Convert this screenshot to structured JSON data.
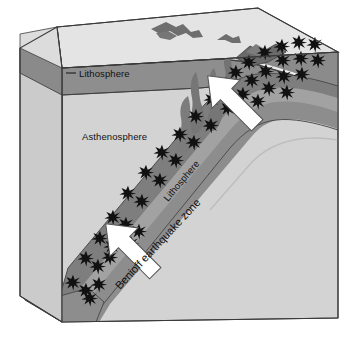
{
  "figure": {
    "type": "geologic-block-diagram"
  },
  "labels": {
    "lithosphere_upper": "Lithosphere",
    "asthenosphere": "Asthenosphere",
    "lithosphere_slab": "Lithosphere",
    "benioff_zone": "Benioff earthquake zone"
  },
  "icons": {
    "earthquake_focus": "star-icon",
    "motion_arrow": "arrow-icon",
    "magma_plume": "magma-plume-icon",
    "volcanic_arc": "volcano-icon"
  },
  "colors": {
    "background": "#ffffff",
    "block_top": "#e3e3e3",
    "block_front": "#d2d2d2",
    "block_left": "#c9c9c9",
    "lithosphere_band": "#8e8e8e",
    "lithosphere_band_dark": "#6f6f6f",
    "crust_thin": "#efefef",
    "slab_core": "#9a9a9a",
    "slab_edge": "#6a6a6a",
    "magma": "#7b7b7b",
    "earthquake_star": "#111111",
    "arrow_fill": "#ffffff",
    "arrow_stroke": "#4a4a4a",
    "outline": "#3a3a3a"
  },
  "geometry": {
    "block_corners": {
      "top_back_left": [
        57,
        27
      ],
      "top_back_right": [
        258,
        8
      ],
      "top_front_right": [
        338,
        52
      ],
      "top_front_left": [
        62,
        68
      ],
      "bottom_front_left": [
        62,
        322
      ],
      "bottom_front_right": [
        338,
        318
      ],
      "bottom_back_left": [
        57,
        283
      ]
    },
    "slab_dip_degrees": 45,
    "arrow_count": 2,
    "earthquake_focus_count": 28
  },
  "earthquake_foci": [
    [
      279,
      47
    ],
    [
      294,
      45
    ],
    [
      309,
      44
    ],
    [
      322,
      46
    ],
    [
      262,
      55
    ],
    [
      276,
      58
    ],
    [
      291,
      57
    ],
    [
      305,
      60
    ],
    [
      247,
      64
    ],
    [
      258,
      70
    ],
    [
      272,
      72
    ],
    [
      286,
      74
    ],
    [
      238,
      76
    ],
    [
      249,
      82
    ],
    [
      263,
      85
    ],
    [
      228,
      88
    ],
    [
      240,
      95
    ],
    [
      214,
      100
    ],
    [
      224,
      106
    ],
    [
      197,
      118
    ],
    [
      208,
      124
    ],
    [
      180,
      137
    ],
    [
      190,
      143
    ],
    [
      163,
      155
    ],
    [
      173,
      161
    ],
    [
      148,
      176
    ],
    [
      158,
      182
    ],
    [
      130,
      198
    ],
    [
      140,
      204
    ],
    [
      118,
      222
    ],
    [
      128,
      228
    ],
    [
      104,
      243
    ],
    [
      114,
      248
    ],
    [
      92,
      262
    ],
    [
      101,
      268
    ],
    [
      80,
      283
    ],
    [
      90,
      288
    ]
  ]
}
